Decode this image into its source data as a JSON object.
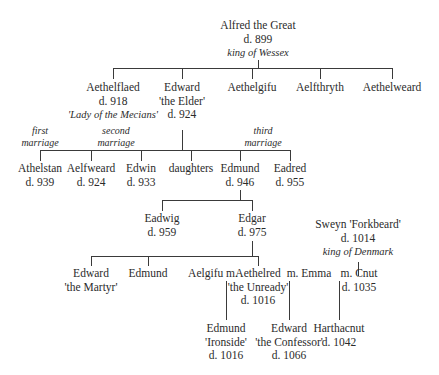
{
  "diagram": {
    "type": "family-tree",
    "people": {
      "alfred": {
        "name": "Alfred the Great",
        "death": "d. 899",
        "title": "king of Wessex"
      },
      "aethelflaed": {
        "name": "Aethelflaed",
        "death": "d. 918",
        "title": "'Lady of the Mecians'"
      },
      "edward_elder": {
        "name": "Edward",
        "epithet": "'the Elder'",
        "death": "d. 924"
      },
      "aethelgifu": {
        "name": "Aethelgifu"
      },
      "aelfthryth": {
        "name": "Aelfthryth"
      },
      "aethelweard": {
        "name": "Aethelweard"
      },
      "athelstan": {
        "name": "Athelstan",
        "death": "d. 939"
      },
      "aelfweard": {
        "name": "Aelfweard",
        "death": "d. 924"
      },
      "edwin": {
        "name": "Edwin",
        "death": "d. 933"
      },
      "daughters": {
        "name": "daughters"
      },
      "edmund_946": {
        "name": "Edmund",
        "death": "d. 946"
      },
      "eadred": {
        "name": "Eadred",
        "death": "d. 955"
      },
      "eadwig": {
        "name": "Eadwig",
        "death": "d. 959"
      },
      "edgar": {
        "name": "Edgar",
        "death": "d. 975"
      },
      "sweyn": {
        "name": "Sweyn 'Forkbeard'",
        "death": "d. 1014",
        "title": "king of Denmark"
      },
      "edward_martyr": {
        "name": "Edward",
        "epithet": "'the Martyr'"
      },
      "edmund_son_edgar": {
        "name": "Edmund"
      },
      "aelgifu": {
        "name": "Aelgifu m."
      },
      "aethelred": {
        "name": "Aethelred",
        "epithet": "'the Unready'",
        "death": "d. 1016"
      },
      "emma": {
        "name": "m. Emma"
      },
      "cnut": {
        "name": "m. Cnut",
        "death": "d. 1035"
      },
      "edmund_ironside": {
        "name": "Edmund",
        "epithet": "'Ironside'",
        "death": "d. 1016"
      },
      "edward_confessor": {
        "name": "Edward",
        "epithet": "'the Confessor'",
        "death": "d. 1066"
      },
      "harthacnut": {
        "name": "Harthacnut",
        "death": "d. 1042"
      }
    },
    "notes": {
      "first": {
        "line1": "first",
        "line2": "marriage"
      },
      "second": {
        "line1": "second",
        "line2": "marriage"
      },
      "third": {
        "line1": "third",
        "line2": "marriage"
      }
    }
  }
}
